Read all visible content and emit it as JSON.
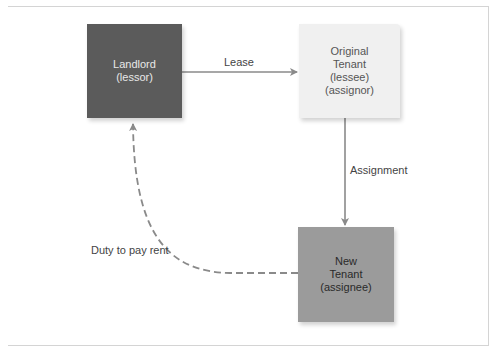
{
  "diagram": {
    "nodes": {
      "landlord": {
        "lines": [
          "Landlord",
          "(lessor)"
        ],
        "color": "#5b5b5b"
      },
      "original_tenant": {
        "lines": [
          "Original",
          "Tenant",
          "(lessee)",
          "(assignor)"
        ],
        "color": "#f0f0f0"
      },
      "new_tenant": {
        "lines": [
          "New",
          "Tenant",
          "(assignee)"
        ],
        "color": "#9b9b9b"
      }
    },
    "edges": {
      "lease": {
        "label": "Lease",
        "from": "Landlord",
        "to": "Original Tenant",
        "style": "solid"
      },
      "assignment": {
        "label": "Assignment",
        "from": "Original Tenant",
        "to": "New Tenant",
        "style": "solid"
      },
      "duty": {
        "label": "Duty to pay rent",
        "from": "New Tenant",
        "to": "Landlord",
        "style": "dashed"
      }
    },
    "arrow_color": "#8a8a8a"
  }
}
